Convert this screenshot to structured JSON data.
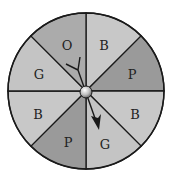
{
  "spinner": {
    "center": [
      86,
      91
    ],
    "radius": 78,
    "sectors": [
      {
        "label": "B",
        "color": "#c8c8c8"
      },
      {
        "label": "P",
        "color": "#9a9a9a"
      },
      {
        "label": "B",
        "color": "#c8c8c8"
      },
      {
        "label": "G",
        "color": "#c4c4c4"
      },
      {
        "label": "P",
        "color": "#9a9a9a"
      },
      {
        "label": "B",
        "color": "#c8c8c8"
      },
      {
        "label": "G",
        "color": "#c4c4c4"
      },
      {
        "label": "O",
        "color": "#ababab"
      }
    ],
    "pointer_sector": "G"
  }
}
